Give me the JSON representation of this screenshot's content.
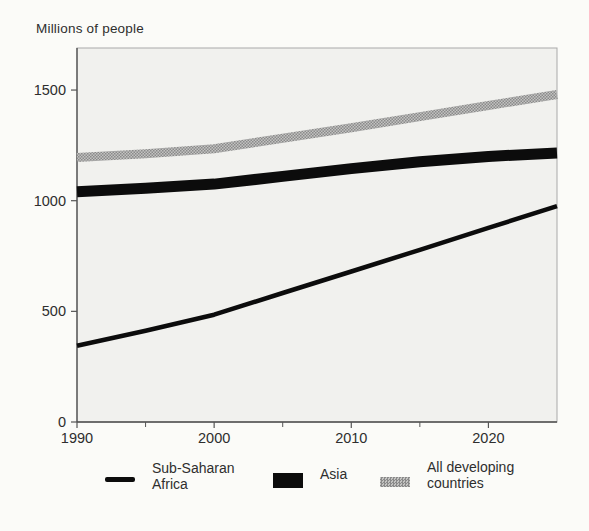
{
  "chart": {
    "title": "Millions of people",
    "plot_bg": "#f1f1ee",
    "page_bg": "#fbfbf8",
    "colors": {
      "line_black": "#0c0c0c",
      "halftone_dark": "#8a8a8a",
      "halftone_light": "#c3c3c1",
      "axis": "#4d4d4d",
      "frame": "#a9a9a9",
      "tick": "#555555",
      "text": "#2e2e2e"
    }
  },
  "chart_data": {
    "type": "line",
    "title": "Millions of people",
    "xlabel": "",
    "ylabel": "Millions of people",
    "x": [
      1990,
      1995,
      2000,
      2005,
      2010,
      2015,
      2020,
      2025
    ],
    "series": [
      {
        "name": "Sub-Saharan Africa",
        "values": [
          345,
          412,
          485,
          583,
          680,
          778,
          877,
          975
        ],
        "style": "thin-black",
        "stroke_width": 4.5
      },
      {
        "name": "Asia",
        "values": [
          1040,
          1056,
          1075,
          1110,
          1145,
          1176,
          1200,
          1215
        ],
        "style": "thick-black",
        "stroke_width": 11
      },
      {
        "name": "All developing countries",
        "values": [
          1195,
          1212,
          1235,
          1282,
          1330,
          1380,
          1430,
          1480
        ],
        "style": "halftone-gray",
        "stroke_width": 9
      }
    ],
    "xlim": [
      1990,
      2025
    ],
    "ylim": [
      0,
      1690
    ],
    "yticks": [
      0,
      500,
      1000,
      1500
    ],
    "xticks_major": [
      1990,
      2000,
      2010,
      2020
    ],
    "xticks_minor": [
      1995,
      2005,
      2015
    ],
    "grid": false,
    "legend_position": "bottom"
  },
  "legend": {
    "items": [
      {
        "label_line1": "Sub-Saharan",
        "label_line2": "Africa",
        "swatch": "thin-line"
      },
      {
        "label_line1": "Asia",
        "label_line2": "",
        "swatch": "solid-rect"
      },
      {
        "label_line1": "All developing",
        "label_line2": "countries",
        "swatch": "halftone-rect"
      }
    ]
  }
}
